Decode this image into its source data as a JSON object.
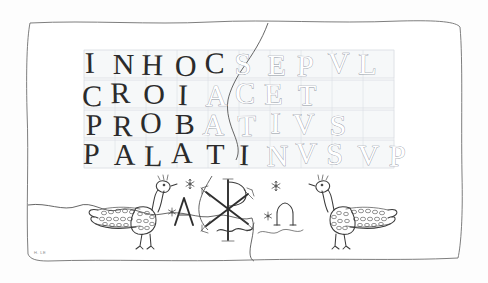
{
  "figure": {
    "kind": "archaeological-line-drawing",
    "frame_style": "hand-drawn rectangular border",
    "background_color": "#ffffff",
    "ink_color": "#2e2e2e",
    "guide_color": "#d9dde3"
  },
  "inscription": {
    "script": "Roman square capitals",
    "reading": "IN HOC SEPVLCRO IACET PROBATIVS PALATINVS VP",
    "lines": [
      {
        "index": 1,
        "text": "INHOCSEPVL",
        "letters": [
          {
            "char": "I",
            "style": "solid"
          },
          {
            "char": "N",
            "style": "solid"
          },
          {
            "char": "H",
            "style": "solid"
          },
          {
            "char": "O",
            "style": "solid"
          },
          {
            "char": "C",
            "style": "solid"
          },
          {
            "char": "S",
            "style": "outline"
          },
          {
            "char": "E",
            "style": "outline"
          },
          {
            "char": "P",
            "style": "outline"
          },
          {
            "char": "V",
            "style": "outline"
          },
          {
            "char": "L",
            "style": "outline"
          }
        ]
      },
      {
        "index": 2,
        "text": "CROIACET",
        "letters": [
          {
            "char": "C",
            "style": "solid"
          },
          {
            "char": "R",
            "style": "solid"
          },
          {
            "char": "O",
            "style": "solid"
          },
          {
            "char": "I",
            "style": "solid"
          },
          {
            "char": "A",
            "style": "outline"
          },
          {
            "char": "C",
            "style": "outline"
          },
          {
            "char": "E",
            "style": "outline"
          },
          {
            "char": "T",
            "style": "outline"
          }
        ]
      },
      {
        "index": 3,
        "text": "PROBATIVS",
        "letters": [
          {
            "char": "P",
            "style": "solid"
          },
          {
            "char": "R",
            "style": "solid"
          },
          {
            "char": "O",
            "style": "solid"
          },
          {
            "char": "B",
            "style": "solid"
          },
          {
            "char": "A",
            "style": "outline"
          },
          {
            "char": "T",
            "style": "outline"
          },
          {
            "char": "I",
            "style": "outline"
          },
          {
            "char": "V",
            "style": "outline"
          },
          {
            "char": "S",
            "style": "outline"
          }
        ]
      },
      {
        "index": 4,
        "text": "PALATINVSVP",
        "letters": [
          {
            "char": "P",
            "style": "solid"
          },
          {
            "char": "A",
            "style": "solid"
          },
          {
            "char": "L",
            "style": "solid"
          },
          {
            "char": "A",
            "style": "solid"
          },
          {
            "char": "T",
            "style": "solid"
          },
          {
            "char": "I",
            "style": "solid"
          },
          {
            "char": "N",
            "style": "outline"
          },
          {
            "char": "V",
            "style": "outline"
          },
          {
            "char": "S",
            "style": "outline"
          },
          {
            "char": "V",
            "style": "outline"
          },
          {
            "char": "P",
            "style": "outline"
          }
        ]
      }
    ]
  },
  "symbols": {
    "christogram": {
      "name": "chi-rho",
      "glyph": "☧",
      "label": "Chi-Rho monogram"
    },
    "alpha": {
      "name": "alpha",
      "glyph": "Α",
      "label": "Alpha"
    },
    "omega": {
      "name": "omega",
      "glyph": "ω",
      "label": "Omega"
    },
    "rosettes": [
      {
        "id": 1,
        "points": 6
      },
      {
        "id": 2,
        "points": 6
      },
      {
        "id": 3,
        "points": 6
      },
      {
        "id": 4,
        "points": 6
      }
    ]
  },
  "figures": [
    {
      "name": "peacock-left",
      "facing": "right",
      "description": "stippled peacock with trailing tail"
    },
    {
      "name": "peacock-right",
      "facing": "left",
      "description": "stippled peacock with trailing tail"
    }
  ],
  "marks": {
    "signature": "H. LE",
    "breakage": "irregular fracture edge crossing upper centre and lower left"
  }
}
